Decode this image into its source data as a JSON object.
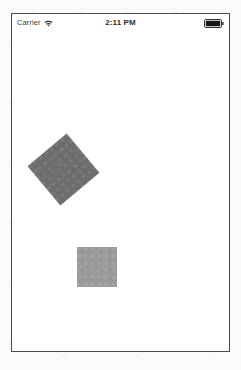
{
  "device": {
    "frame_color": "#4a4a4a",
    "screen_background": "#ffffff"
  },
  "status_bar": {
    "carrier_label": "Carrier",
    "wifi_icon": "wifi-icon",
    "time": "2:11 PM",
    "battery_icon": "battery-full-icon",
    "battery_state": "full",
    "text_color": "#3a3a3a"
  },
  "canvas": {
    "shapes": [
      {
        "name": "rotated-square",
        "type": "square",
        "fill": "#6e6e6e",
        "size": 51,
        "rotation_deg": -40,
        "center_x": 64,
        "center_y": 170
      },
      {
        "name": "plain-square",
        "type": "square",
        "fill": "#9a9a9a",
        "size": 40,
        "rotation_deg": 0,
        "center_x": 97,
        "center_y": 267
      }
    ]
  }
}
